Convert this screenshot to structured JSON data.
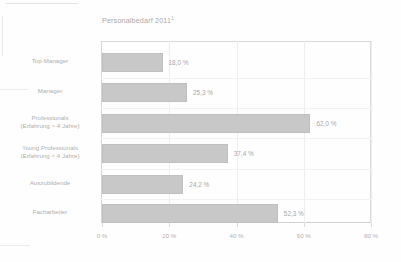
{
  "chart_data": {
    "type": "bar",
    "orientation": "horizontal",
    "title": "Personalbedarf 2011",
    "title_footnote": "1",
    "xlabel": "",
    "ylabel": "",
    "xlim": [
      0,
      80
    ],
    "grid": true,
    "legend": "none",
    "categories": [
      "Top-Manager",
      "Manager",
      "Professionals\n(Erfahrung > 4 Jahre)",
      "Young Professionals\n(Erfahrung < 4 Jahre)",
      "Auszubildende",
      "Facharbeiter"
    ],
    "values": [
      18.0,
      25.3,
      62.0,
      37.4,
      24.2,
      52.3
    ],
    "value_labels": [
      "18,0 %",
      "25,3 %",
      "62,0 %",
      "37,4 %",
      "24,2 %",
      "52,3 %"
    ],
    "xticks": [
      0,
      20,
      40,
      60,
      80
    ],
    "xtick_labels": [
      "0 %",
      "20 %",
      "40 %",
      "60 %",
      "80 %"
    ],
    "colors": {
      "bar_fill": "#c8c8c8",
      "bar_border": "#c0c0c0",
      "frame": "#d5d5d5",
      "grid": "#eeeeee",
      "text": "#b0b0b0",
      "background": "#fefefe"
    }
  }
}
